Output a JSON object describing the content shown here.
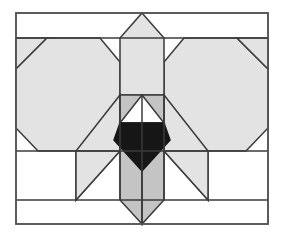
{
  "figure": {
    "canvas": {
      "width": 284,
      "height": 236
    },
    "background_color": "#ffffff"
  },
  "palette": {
    "background": "#ffffff",
    "light_gray": "#e3e3e3",
    "mid_gray": "#c4c4c4",
    "dark_fill": "#161616",
    "white_fill": "#ffffff",
    "stroke": "#3b3b3b",
    "frame_stroke": "#555555"
  },
  "stroke_widths": {
    "frame": 1.6,
    "tile": 1.5,
    "band": 1.4
  },
  "frame": {
    "name": "outer-rectangle",
    "x": 16,
    "y": 13,
    "width": 252,
    "height": 211,
    "fill": "#ffffff",
    "stroke": "#555555"
  },
  "bands": [
    {
      "name": "top-band-divider",
      "y": 38,
      "x1": 16,
      "x2": 268
    },
    {
      "name": "upper-mid-divider",
      "y": 151,
      "x1": 16,
      "x2": 268
    },
    {
      "name": "lower-band-divider",
      "y": 200,
      "x1": 16,
      "x2": 268
    }
  ],
  "shapes": [
    {
      "name": "left-heptagon",
      "type": "polygon",
      "fill": "#e3e3e3",
      "stroke": "#3b3b3b",
      "points": "16,38 47,38 16,69"
    },
    {
      "name": "left-heptagon-body",
      "type": "polygon",
      "fill": "#e3e3e3",
      "stroke": "#3b3b3b",
      "points": "47,38 100,38 120,62 120,95 88,151 38,151 16,128 16,69"
    },
    {
      "name": "right-heptagon-body",
      "type": "polygon",
      "fill": "#e3e3e3",
      "stroke": "#3b3b3b",
      "points": "237,38 184,38 164,62 164,95 196,151 246,151 268,128 268,69"
    },
    {
      "name": "right-corner-triangle",
      "type": "polygon",
      "fill": "#e3e3e3",
      "stroke": "#3b3b3b",
      "points": "268,38 237,38 268,69"
    },
    {
      "name": "center-pentagon-house",
      "type": "polygon",
      "fill": "#e3e3e3",
      "stroke": "#3b3b3b",
      "points": "142,13 164,38 164,95 120,95 120,38"
    },
    {
      "name": "left-wing-parallelogram",
      "type": "polygon",
      "fill": "#e3e3e3",
      "stroke": "#3b3b3b",
      "points": "120,95 120,151 76,200 76,151"
    },
    {
      "name": "left-wing-lower-triangle",
      "type": "polygon",
      "fill": "#e3e3e3",
      "stroke": "#3b3b3b",
      "points": "76,151 76,200 120,151"
    },
    {
      "name": "right-wing-parallelogram",
      "type": "polygon",
      "fill": "#e3e3e3",
      "stroke": "#3b3b3b",
      "points": "164,95 164,151 208,200 208,151"
    },
    {
      "name": "right-wing-lower-triangle",
      "type": "polygon",
      "fill": "#e3e3e3",
      "stroke": "#3b3b3b",
      "points": "208,151 208,200 164,151"
    },
    {
      "name": "center-left-column",
      "type": "polygon",
      "fill": "#c4c4c4",
      "stroke": "#3b3b3b",
      "points": "120,95 142,95 142,224 120,200"
    },
    {
      "name": "center-right-column",
      "type": "polygon",
      "fill": "#c4c4c4",
      "stroke": "#3b3b3b",
      "points": "164,95 142,95 142,224 164,200"
    },
    {
      "name": "center-white-triangle",
      "type": "polygon",
      "fill": "#ffffff",
      "stroke": "#3b3b3b",
      "points": "142,95 164,123 120,123"
    },
    {
      "name": "center-dark-hexagon",
      "type": "polygon",
      "fill": "#161616",
      "stroke": "#161616",
      "points": "120,123 164,123 170,140 142,171 114,140"
    }
  ],
  "guides": [
    {
      "name": "center-seam",
      "x1": 142,
      "y1": 95,
      "x2": 142,
      "y2": 224
    },
    {
      "name": "left-column-edge",
      "x1": 120,
      "y1": 95,
      "x2": 120,
      "y2": 200
    },
    {
      "name": "right-column-edge",
      "x1": 164,
      "y1": 95,
      "x2": 164,
      "y2": 200
    }
  ]
}
